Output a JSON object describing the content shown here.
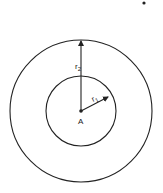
{
  "diagram": {
    "title": "",
    "center": {
      "label": "A",
      "x": 81,
      "y": 111
    },
    "circles": [
      {
        "name": "outer",
        "radius": 71
      },
      {
        "name": "inner",
        "radius": 35
      }
    ],
    "radii": [
      {
        "label": "r",
        "subscript": "2",
        "direction": "up"
      },
      {
        "label": "r",
        "subscript": "1",
        "direction": "up-right"
      }
    ],
    "stray_dot": {
      "x": 144,
      "y": 3
    },
    "colors": {
      "stroke": "#222222",
      "background": "#ffffff"
    }
  }
}
